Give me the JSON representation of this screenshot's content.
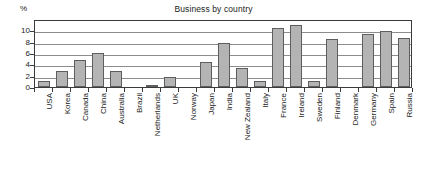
{
  "chart_data": {
    "type": "bar",
    "title": "Business by country",
    "xlabel": "",
    "ylabel": "%",
    "ylim": [
      0,
      12
    ],
    "yticks": [
      0,
      2,
      4,
      6,
      8,
      10
    ],
    "ytick_labels": [
      "0",
      "2",
      "4",
      "6",
      "8",
      "10"
    ],
    "grid": true,
    "legend": "none",
    "categories": [
      "USA",
      "Korea",
      "Canada",
      "China",
      "Australia",
      "Brazil",
      "Netherlands",
      "UK",
      "Norway",
      "Japan",
      "India",
      "New Zealand",
      "Italy",
      "France",
      "Ireland",
      "Sweden",
      "Finland",
      "Denmark",
      "Germany",
      "Spain",
      "Russia"
    ],
    "values": [
      1.0,
      2.8,
      4.8,
      6.0,
      2.9,
      0.0,
      0.4,
      1.8,
      0.0,
      4.5,
      7.8,
      3.3,
      1.1,
      10.4,
      11.0,
      1.0,
      8.5,
      0.0,
      9.3,
      9.9,
      8.7
    ],
    "bar_fill_color": "#b4b4b4",
    "bar_border_color": "#5e5e5e",
    "gridline_color": "#8c8c8c",
    "axis_color": "#3b3b3b"
  }
}
